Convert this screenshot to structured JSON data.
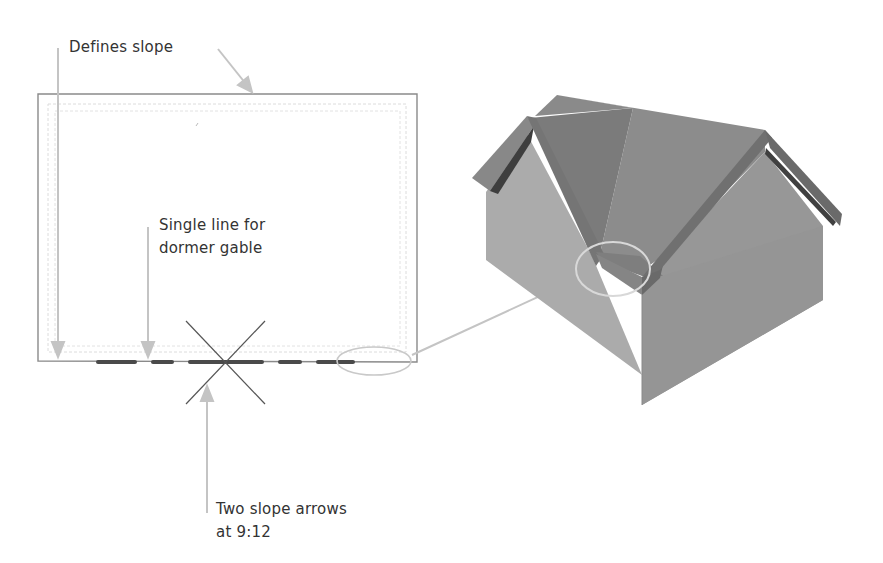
{
  "annotations": {
    "defines_slope": "Defines slope",
    "single_line_l1": "Single line for",
    "single_line_l2": "dormer gable",
    "slope_arrows_l1": "Two slope arrows",
    "slope_arrows_l2": "at 9:12"
  },
  "colors": {
    "text": "#333333",
    "callout": "#c4c4c4",
    "plan_outline": "#7a7a7a",
    "plan_inner": "#d8d8d8",
    "slope_arrow_dash": "#555555",
    "roof_main": "#8a8a8a",
    "roof_dormer": "#7a7a7a",
    "wall_left": "#a9a9a9",
    "wall_right": "#979797",
    "fascia": "#6e6e6e",
    "fascia_dark": "#3c3c3c"
  }
}
